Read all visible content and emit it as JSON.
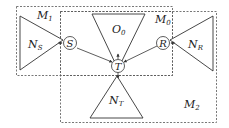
{
  "diagram": {
    "regions": [
      {
        "id": "M1",
        "label": "M",
        "sub": "1"
      },
      {
        "id": "M0",
        "label": "M",
        "sub": "0"
      },
      {
        "id": "M2",
        "label": "M",
        "sub": "2"
      }
    ],
    "nodes": [
      {
        "id": "S",
        "label": "S"
      },
      {
        "id": "R",
        "label": "R"
      },
      {
        "id": "T",
        "label": "T"
      }
    ],
    "triangles": [
      {
        "id": "NS",
        "label": "N",
        "sub": "S"
      },
      {
        "id": "NR",
        "label": "N",
        "sub": "R"
      },
      {
        "id": "NT",
        "label": "N",
        "sub": "T"
      },
      {
        "id": "O0",
        "label": "O",
        "sub": "0"
      }
    ],
    "colors": {
      "line": "#333333",
      "dash": "#555555",
      "background": "#ffffff"
    }
  }
}
